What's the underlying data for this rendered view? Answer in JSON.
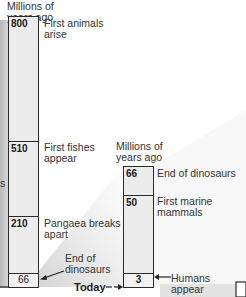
{
  "left_timeline": {
    "caption_line1": "Millions of",
    "caption_line2": "years ago",
    "segments": [
      {
        "value": "800",
        "event_line1": "First animals",
        "event_line2": "arise"
      },
      {
        "value": "510",
        "event_line1": "First fishes",
        "event_line2": "appear"
      },
      {
        "value": "210",
        "event_line1": "Pangaea breaks",
        "event_line2": "apart"
      },
      {
        "value": "66",
        "event_line1": "End of",
        "event_line2": "dinosaurs"
      }
    ]
  },
  "right_timeline": {
    "caption_line1": "Millions of",
    "caption_line2": "years ago",
    "segments": [
      {
        "value": "66",
        "event_line1": "End of dinosaurs",
        "event_line2": ""
      },
      {
        "value": "50",
        "event_line1": "First marine",
        "event_line2": "mammals"
      },
      {
        "value": "3",
        "event_line1": "Humans",
        "event_line2": "appear"
      }
    ]
  },
  "today_label": "Today",
  "left_edge_fragment": "s",
  "colors": {
    "bar_fill": "#ececec",
    "bar_border": "#2a2a2a",
    "wedge_shade": "#d9d9d9"
  }
}
